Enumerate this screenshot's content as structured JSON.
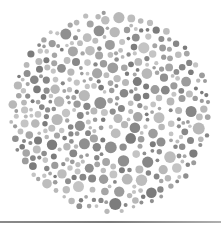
{
  "image": {
    "kind": "color-vision test plate (grayscale dot pattern)",
    "width": 221,
    "height": 230
  },
  "plate": {
    "center_x": 110,
    "center_y": 112,
    "radius": 102,
    "seed": 7,
    "dot_radius_min": 1.8,
    "dot_radius_max": 6.2,
    "attempts": 9000,
    "colors": {
      "light": [
        "#c4c4c4",
        "#b8b8b8",
        "#bdbdbd"
      ],
      "mid": [
        "#a6a6a6",
        "#9c9c9c"
      ],
      "dark": [
        "#878787",
        "#7c7c7c",
        "#8f8f8f"
      ]
    },
    "background": "#ffffff"
  },
  "rule": {
    "y": 221,
    "color": "#8a8a8a"
  }
}
